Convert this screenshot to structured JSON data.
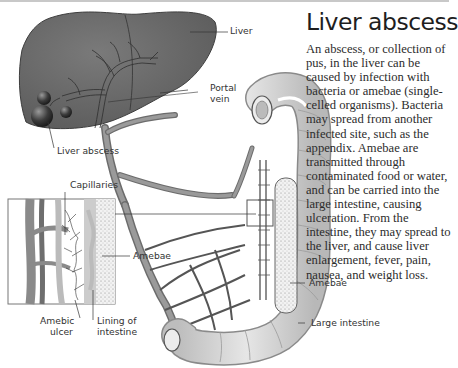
{
  "title": "Liver abscess",
  "description": "An abscess, or collection of pus, in the liver can be caused by infection with bacteria or amebae (single-celled organisms). Bacteria may spread from another infected site, such as the appendix. Amebae are transmitted through contaminated food or water, and can be carried into the large intestine, causing ulceration. From the intestine, they may spread to the liver, and cause liver enlargement, fever, pain, nausea, and weight loss.",
  "labels": {
    "liver": "Liver",
    "portal_vein_1": "Portal",
    "portal_vein_2": "vein",
    "liver_abscess": "Liver abscess",
    "capillaries": "Capillaries",
    "amebae_inset": "Amebae",
    "amebic_ulcer_1": "Amebic",
    "amebic_ulcer_2": "ulcer",
    "lining_1": "Lining of",
    "lining_2": "intestine",
    "amebae_colon": "Amebae",
    "large_intestine": "Large intestine"
  },
  "colors": {
    "liver": "#6e6e6e",
    "vein": "#8a8a8a",
    "intestine": "#d6d6d6",
    "text": "#2a2a2a"
  }
}
